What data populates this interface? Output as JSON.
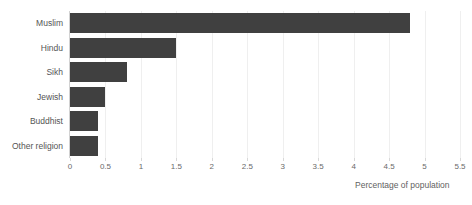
{
  "chart_data": {
    "type": "bar",
    "orientation": "horizontal",
    "title": "",
    "subtitle": "",
    "categories": [
      "Muslim",
      "Hindu",
      "Sikh",
      "Jewish",
      "Buddhist",
      "Other religion"
    ],
    "values": [
      4.8,
      1.5,
      0.8,
      0.5,
      0.4,
      0.4
    ],
    "xlabel": "Percentage of population",
    "ylabel": "",
    "xlim": [
      0,
      5.5
    ],
    "xticks": [
      0,
      0.5,
      1,
      1.5,
      2,
      2.5,
      3,
      3.5,
      4,
      4.5,
      5,
      5.5
    ],
    "xtick_labels": [
      "0",
      "0.5",
      "1",
      "1.5",
      "2",
      "2.5",
      "3",
      "3.5",
      "4",
      "4.5",
      "5",
      "5.5"
    ],
    "grid": "vertical",
    "legend": null,
    "legend_position": "none",
    "annotations": [],
    "colors": {
      "bar": "#404040",
      "background": "#ffffff",
      "gridline": "#efefef",
      "axis": "#d2d2d2",
      "tick_label": "#6a6a6a",
      "category_label": "#555555",
      "axis_title": "#5f5f5f"
    }
  }
}
